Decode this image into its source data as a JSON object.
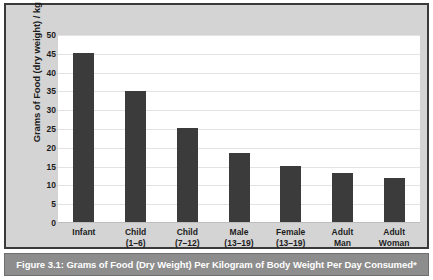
{
  "figure": {
    "caption": "Figure 3.1: Grams of Food (Dry Weight) Per Kilogram of Body Weight Per Day Consumed*"
  },
  "colors": {
    "bar": "#3b3b3b",
    "panel_background": "#d4d4d4",
    "plot_background": "#ffffff",
    "gridline": "#e3e3e3",
    "caption_background": "#8d8d8d",
    "caption_text": "#ffffff",
    "frame": "#3a3a3a"
  },
  "chart_data": {
    "type": "bar",
    "title": "",
    "xlabel": "",
    "ylabel": "Grams of Food (dry weight) / kg / day",
    "ylim": [
      0,
      50
    ],
    "yticks": [
      0,
      5,
      10,
      15,
      20,
      25,
      30,
      35,
      40,
      45,
      50
    ],
    "ytick_labels": [
      "0",
      "5",
      "10",
      "15",
      "20",
      "25",
      "30",
      "35",
      "40",
      "45",
      "50"
    ],
    "grid": true,
    "legend": false,
    "categories": [
      "Infant",
      "Child (1–6)",
      "Child (7–12)",
      "Male (13–19)",
      "Female (13–19)",
      "Adult Man",
      "Adult Woman"
    ],
    "category_lines": [
      [
        "Infant",
        ""
      ],
      [
        "Child",
        "(1–6)"
      ],
      [
        "Child",
        "(7–12)"
      ],
      [
        "Male",
        "(13–19)"
      ],
      [
        "Female",
        "(13–19)"
      ],
      [
        "Adult",
        "Man"
      ],
      [
        "Adult",
        "Woman"
      ]
    ],
    "values": [
      45.3,
      35.0,
      25.3,
      18.5,
      15.2,
      13.4,
      12.0
    ]
  }
}
